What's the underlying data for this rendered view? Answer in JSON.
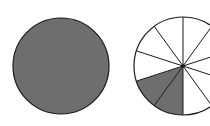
{
  "figure": {
    "colors": {
      "fill": "#6e6e6e",
      "stroke": "#1a1a1a",
      "background": "#ffffff",
      "empty": "#ffffff"
    },
    "left_circle": {
      "cx": 61,
      "cy": 66,
      "r": 48,
      "total_parts": 1,
      "shaded_parts": 1
    },
    "right_circle": {
      "cx": 183,
      "cy": 66,
      "r": 49,
      "total_parts": 10,
      "shaded_parts": 2,
      "start_angle_deg": 90,
      "shaded_sector_indices": [
        3,
        4
      ]
    }
  }
}
